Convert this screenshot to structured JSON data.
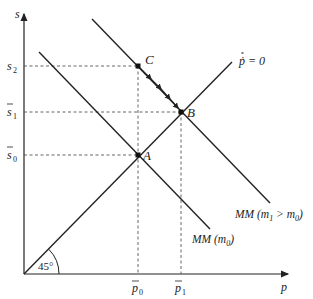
{
  "diagram": {
    "axes": {
      "y_label": "s",
      "x_label": "p",
      "angle_label": "45°"
    },
    "y_ticks": [
      {
        "label": "s",
        "sub": "2",
        "bar": false
      },
      {
        "label": "s",
        "sub": "1",
        "bar": true
      },
      {
        "label": "s",
        "sub": "0",
        "bar": true
      }
    ],
    "x_ticks": [
      {
        "label": "p",
        "sub": "0",
        "bar": true
      },
      {
        "label": "p",
        "sub": "1",
        "bar": true
      }
    ],
    "points": [
      {
        "label": "A"
      },
      {
        "label": "B"
      },
      {
        "label": "C"
      }
    ],
    "curves": {
      "pdot_zero": "ṗ = 0",
      "mm_m0": {
        "prefix": "MM (m",
        "sub": "0",
        "suffix": ")"
      },
      "mm_m1": {
        "prefix": "MM (m",
        "sub1": "1",
        "mid": " > m",
        "sub2": "0",
        "suffix": ")"
      }
    },
    "colors": {
      "line": "#222222",
      "dashed": "#555555"
    }
  }
}
